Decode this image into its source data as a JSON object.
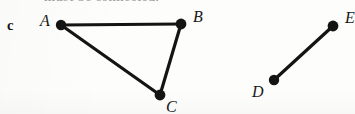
{
  "figure": {
    "part_label": "c",
    "clipped_caption_top": "must be connected.",
    "background_color": "#fdfdfc",
    "ink_color": "#141414"
  },
  "graph": {
    "vertices": [
      {
        "id": "A",
        "label": "A",
        "cx": 61,
        "cy": 25,
        "r": 5.2,
        "label_x": 40,
        "label_y": 13
      },
      {
        "id": "B",
        "label": "B",
        "cx": 181,
        "cy": 24,
        "r": 5.4,
        "label_x": 193,
        "label_y": 9
      },
      {
        "id": "C",
        "label": "C",
        "cx": 160,
        "cy": 95,
        "r": 5.4,
        "label_x": 166,
        "label_y": 99
      },
      {
        "id": "D",
        "label": "D",
        "cx": 274,
        "cy": 80,
        "r": 5.2,
        "label_x": 252,
        "label_y": 84
      },
      {
        "id": "E",
        "label": "E",
        "cx": 333,
        "cy": 26,
        "r": 5.4,
        "label_x": 345,
        "label_y": 10
      }
    ],
    "edges": [
      {
        "id": "AB",
        "from": "A",
        "to": "B",
        "width": 3.2
      },
      {
        "id": "AC",
        "from": "A",
        "to": "C",
        "width": 3.2
      },
      {
        "id": "BC",
        "from": "B",
        "to": "C",
        "width": 3.2
      },
      {
        "id": "DE",
        "from": "D",
        "to": "E",
        "width": 3.2
      }
    ],
    "components": [
      {
        "name": "triangle-component",
        "vertices": [
          "A",
          "B",
          "C"
        ]
      },
      {
        "name": "edge-component",
        "vertices": [
          "D",
          "E"
        ]
      }
    ]
  }
}
